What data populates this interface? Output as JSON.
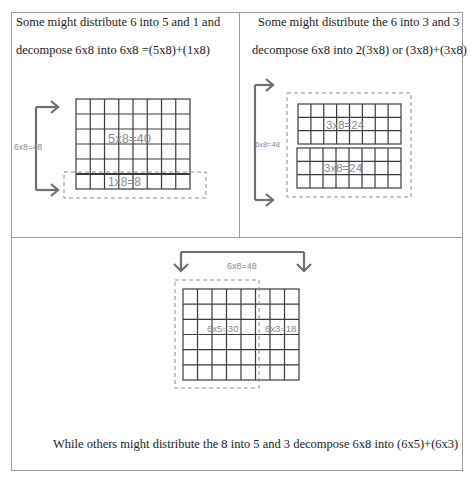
{
  "panels": [
    {
      "id": "split-5-1",
      "caption_line1": "Some might distribute 6 into 5 and 1 and",
      "caption_line2": "decompose 6x8 into 6x8 =(5x8)+(1x8)",
      "bracket_label": "6x8=48",
      "grid": {
        "cols": 8,
        "rows": 6
      },
      "parts": [
        {
          "label": "5x8=40",
          "rows": 5
        },
        {
          "label": "1x8=8",
          "rows": 1
        }
      ]
    },
    {
      "id": "split-3-3",
      "caption_line1": "Some might distribute the 6 into 3 and 3",
      "caption_line2": "decompose 6x8 into 2(3x8) or (3x8)+(3x8)",
      "bracket_label": "6x8=48",
      "grid": {
        "cols": 8,
        "rows": 6
      },
      "parts": [
        {
          "label": "3x8=24",
          "rows": 3
        },
        {
          "label": "3x8=24",
          "rows": 3
        }
      ]
    },
    {
      "id": "split-5-3-cols",
      "caption": "While others might distribute the 8 into 5 and 3 decompose 6x8 into (6x5)+(6x3)",
      "bracket_label": "6x8=48",
      "grid": {
        "cols": 8,
        "rows": 6
      },
      "parts": [
        {
          "label": "6x5=30",
          "cols": 5
        },
        {
          "label": "6x3=18",
          "cols": 3
        }
      ]
    }
  ],
  "colors": {
    "grid_line": "#3a3a3a",
    "arrow": "#6e6e6e",
    "label": "#8a8a8a",
    "dashed": "#8a8a8a",
    "border": "#9a9a9a"
  }
}
